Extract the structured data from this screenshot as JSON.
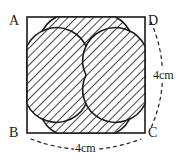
{
  "figure": {
    "kind": "geometry-diagram",
    "square": {
      "vertices": [
        {
          "name": "A",
          "position": "top-left"
        },
        {
          "name": "D",
          "position": "top-right"
        },
        {
          "name": "B",
          "position": "bottom-left"
        },
        {
          "name": "C",
          "position": "bottom-right"
        }
      ],
      "side_length": "4cm",
      "stroke_color": "#1a1a1a"
    },
    "dimensions": [
      {
        "id": "right-side",
        "label": "4cm",
        "from": "D",
        "to": "C",
        "style": "dashed-arc"
      },
      {
        "id": "bottom-side",
        "label": "4cm",
        "from": "B",
        "to": "C",
        "style": "dashed-arc"
      }
    ],
    "petals": {
      "count": 4,
      "orientation": [
        "top",
        "right",
        "bottom",
        "left"
      ],
      "fill": "diagonal-hatch",
      "hatch_color": "#1a1a1a",
      "background": "#ffffff"
    }
  },
  "labels": {
    "vertex_a": "A",
    "vertex_b": "B",
    "vertex_c": "C",
    "vertex_d": "D",
    "dim_right": "4cm",
    "dim_bottom": "4cm"
  }
}
